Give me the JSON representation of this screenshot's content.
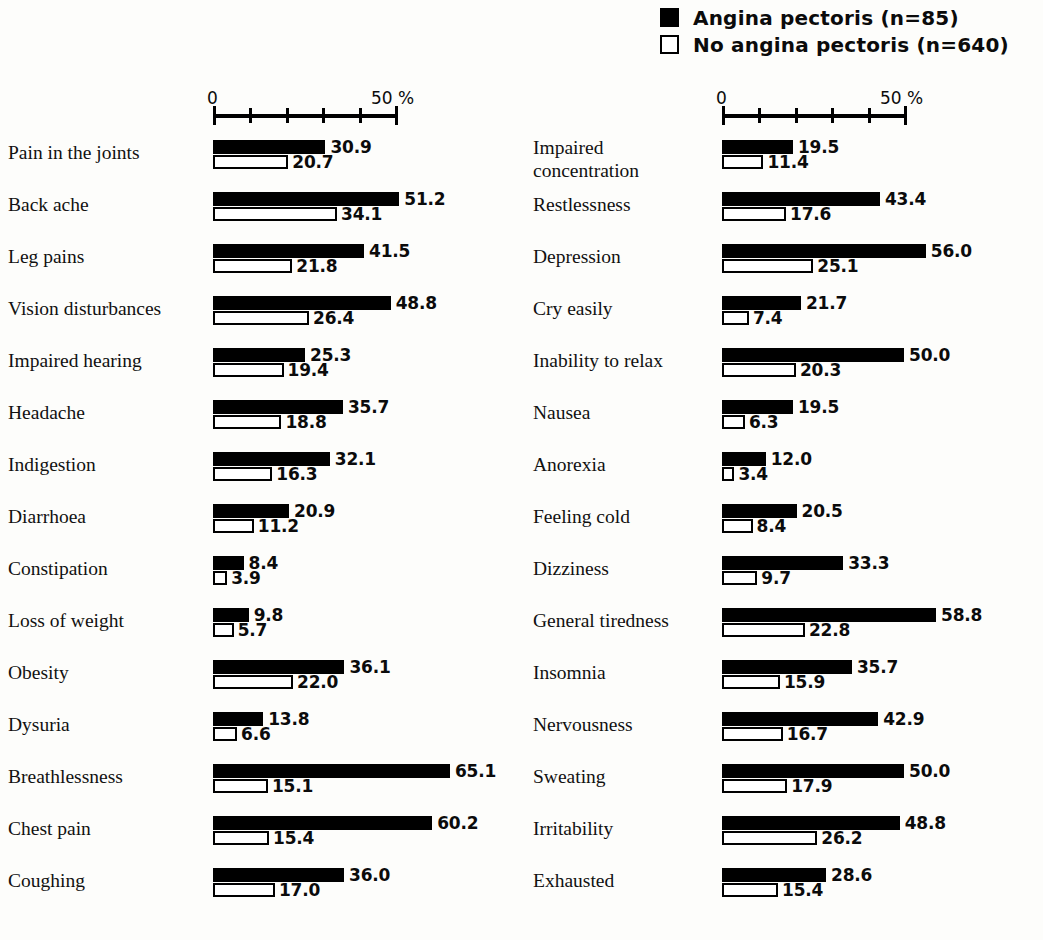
{
  "legend": {
    "items": [
      {
        "label": "Angina pectoris (n=85)",
        "style": "filled"
      },
      {
        "label": "No angina pectoris (n=640)",
        "style": "hollow"
      }
    ]
  },
  "axis": {
    "min_label": "0",
    "max_label": "50 %",
    "min": 0,
    "max": 50,
    "tick_step": 10,
    "ticks": [
      0,
      10,
      20,
      30,
      40,
      50
    ]
  },
  "chart_data": {
    "type": "bar",
    "title": "",
    "xlabel": "50 %",
    "ylabel": "",
    "orientation": "horizontal",
    "grid": false,
    "legend_position": "top-right",
    "xlim": [
      0,
      50
    ],
    "axis_max_plotted": 70,
    "series": [
      {
        "name": "Angina pectoris (n=85)",
        "style": "filled"
      },
      {
        "name": "No angina pectoris (n=640)",
        "style": "hollow"
      }
    ],
    "columns": [
      {
        "name": "left",
        "categories": [
          "Pain in the joints",
          "Back ache",
          "Leg pains",
          "Vision disturbances",
          "Impaired hearing",
          "Headache",
          "Indigestion",
          "Diarrhoea",
          "Constipation",
          "Loss of weight",
          "Obesity",
          "Dysuria",
          "Breathlessness",
          "Chest pain",
          "Coughing"
        ],
        "angina": [
          30.9,
          51.2,
          41.5,
          48.8,
          25.3,
          35.7,
          32.1,
          20.9,
          8.4,
          9.8,
          36.1,
          13.8,
          65.1,
          60.2,
          36.0
        ],
        "no_angina": [
          20.7,
          34.1,
          21.8,
          26.4,
          19.4,
          18.8,
          16.3,
          11.2,
          3.9,
          5.7,
          22.0,
          6.6,
          15.1,
          15.4,
          17.0
        ]
      },
      {
        "name": "right",
        "categories": [
          "Impaired\nconcentration",
          "Restlessness",
          "Depression",
          "Cry easily",
          "Inability to relax",
          "Nausea",
          "Anorexia",
          "Feeling cold",
          "Dizziness",
          "General tiredness",
          "Insomnia",
          "Nervousness",
          "Sweating",
          "Irritability",
          "Exhausted"
        ],
        "angina": [
          19.5,
          43.4,
          56.0,
          21.7,
          50.0,
          19.5,
          12.0,
          20.5,
          33.3,
          58.8,
          35.7,
          42.9,
          50.0,
          48.8,
          28.6
        ],
        "no_angina": [
          11.4,
          17.6,
          25.1,
          7.4,
          20.3,
          6.3,
          3.4,
          8.4,
          9.7,
          22.8,
          15.9,
          16.7,
          17.9,
          26.2,
          15.4
        ]
      }
    ]
  },
  "colors": {
    "background": "#fdfdfb",
    "ink": "#000000",
    "angina_fill": "#000000",
    "no_angina_fill": "#ffffff"
  },
  "layout": {
    "left": {
      "bar_origin_px": 213,
      "px_per_unit": 3.64,
      "label_right_px": 200
    },
    "right": {
      "bar_origin_px": 217,
      "px_per_unit": 3.64,
      "label_right_px": 205
    }
  }
}
